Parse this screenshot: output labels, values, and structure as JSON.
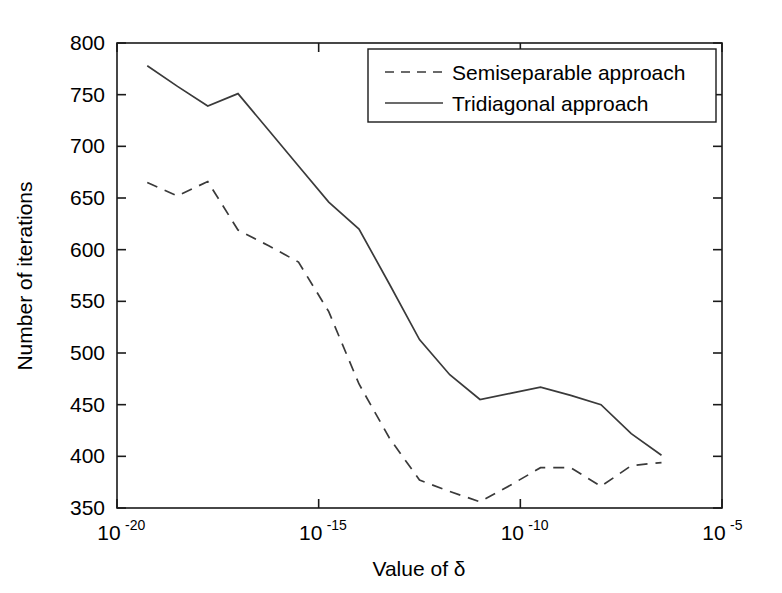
{
  "chart_data": {
    "type": "line",
    "title": "",
    "xlabel": "Value of δ",
    "ylabel": "Number of iterations",
    "xscale": "log",
    "yscale": "linear",
    "xlim": [
      1e-20,
      1e-05
    ],
    "ylim": [
      350,
      800
    ],
    "grid": false,
    "legend_position": "top-right",
    "xtick_labels": [
      "10⁻²⁰",
      "10⁻¹⁵",
      "10⁻¹⁰",
      "10⁻⁵"
    ],
    "xtick_bases": [
      "10",
      "10",
      "10",
      "10"
    ],
    "xtick_exponents": [
      "-20",
      "-15",
      "-10",
      "-5"
    ],
    "xtick_values": [
      1e-20,
      1e-15,
      1e-10,
      1e-05
    ],
    "ytick_labels": [
      "350",
      "400",
      "450",
      "500",
      "550",
      "600",
      "650",
      "700",
      "750",
      "800"
    ],
    "ytick_values": [
      350,
      400,
      450,
      500,
      550,
      600,
      650,
      700,
      750,
      800
    ],
    "x_log10": [
      -19.25,
      -18.5,
      -17.75,
      -17.0,
      -16.25,
      -15.5,
      -14.75,
      -14.0,
      -13.25,
      -12.5,
      -11.75,
      -11.0,
      -10.25,
      -9.5,
      -8.75,
      -8.0,
      -7.25,
      -6.5
    ],
    "series": [
      {
        "name": "Semiseparable approach",
        "style": "dashed",
        "color": "#3a3a3a",
        "values": [
          665,
          652,
          666,
          619,
          604,
          588,
          540,
          470,
          418,
          377,
          366,
          356,
          372,
          389,
          389,
          371,
          391,
          394
        ]
      },
      {
        "name": "Tridiagonal approach",
        "style": "solid",
        "color": "#3a3a3a",
        "values": [
          778,
          758,
          739,
          751,
          716,
          681,
          646,
          620,
          567,
          513,
          479,
          455,
          461,
          467,
          459,
          450,
          422,
          401
        ]
      }
    ]
  },
  "legend": {
    "entries": [
      {
        "label": "Semiseparable approach",
        "style": "dashed"
      },
      {
        "label": "Tridiagonal approach",
        "style": "solid"
      }
    ]
  },
  "axes": {
    "x_title": "Value of δ",
    "y_title": "Number of iterations"
  },
  "colors": {
    "line": "#3a3a3a",
    "frame": "#1a1a1a",
    "background": "#ffffff",
    "text": "#000000"
  }
}
